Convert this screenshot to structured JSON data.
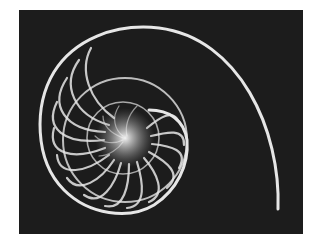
{
  "image": {
    "subject": "nautilus-shell-xray",
    "background_color": "#ffffff",
    "photo_background_color": "#1c1c1c",
    "shell_color": "#e8e8e8"
  }
}
